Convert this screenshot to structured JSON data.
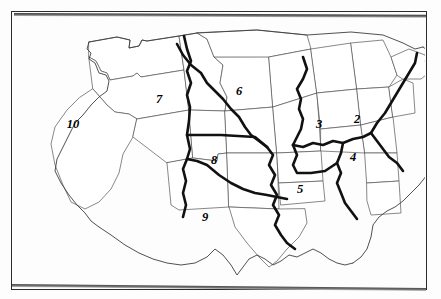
{
  "figure": {
    "kind": "map",
    "background_color": "#ffffff",
    "frame_color": "#2b2b2b",
    "line_color": "#555555",
    "region_boundary_color": "#111111",
    "label_color": "#000000"
  },
  "regions": [
    {
      "id": "region-2",
      "label": "2",
      "name": "mid-atlantic",
      "x": 356,
      "y": 119
    },
    {
      "id": "region-3",
      "label": "3",
      "name": "east-north-central",
      "x": 318,
      "y": 124
    },
    {
      "id": "region-4",
      "label": "4",
      "name": "south-atlantic",
      "x": 352,
      "y": 157
    },
    {
      "id": "region-5",
      "label": "5",
      "name": "east-south-central",
      "x": 299,
      "y": 189
    },
    {
      "id": "region-6",
      "label": "6",
      "name": "upper-midwest",
      "x": 238,
      "y": 91
    },
    {
      "id": "region-7",
      "label": "7",
      "name": "northern-rockies",
      "x": 158,
      "y": 99
    },
    {
      "id": "region-8",
      "label": "8",
      "name": "southern-plains",
      "x": 213,
      "y": 160
    },
    {
      "id": "region-9",
      "label": "9",
      "name": "south-central",
      "x": 204,
      "y": 217
    },
    {
      "id": "region-10",
      "label": "10",
      "name": "west",
      "x": 71,
      "y": 124
    }
  ]
}
